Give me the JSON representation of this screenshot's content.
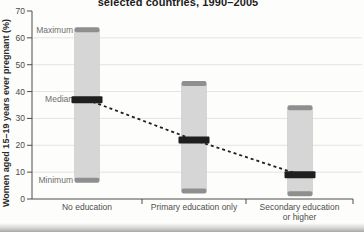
{
  "chart_data": {
    "type": "bar",
    "subtype": "range-bar-min-median-max",
    "title": "selected countries, 1990–2005",
    "ylabel": "Women aged 15–19 years ever pregnant (%)",
    "xlabel": "",
    "ylim": [
      0,
      70
    ],
    "y_ticks": [
      0,
      10,
      20,
      30,
      40,
      50,
      60,
      70
    ],
    "grid": true,
    "legend_position": "none",
    "categories": [
      "No education",
      "Primary education only",
      "Secondary education or higher"
    ],
    "series": [
      {
        "name": "Maximum",
        "values": [
          63,
          43,
          34
        ]
      },
      {
        "name": "Median",
        "values": [
          37,
          22,
          9
        ]
      },
      {
        "name": "Minimum",
        "values": [
          7,
          3,
          2
        ]
      }
    ],
    "median_trend_line": {
      "style": "dashed",
      "values": [
        37,
        22,
        9
      ]
    },
    "annotations": {
      "maximum": "Maximum",
      "median": "Median",
      "minimum": "Minimum"
    },
    "colors": {
      "bar_fill": "#d6d6d6",
      "bar_edge": "#c3c3c3",
      "range_cap": "#8f8f8f",
      "median_band": "#1f1f1f",
      "trend_line": "#1f1f1f",
      "gridline": "#e4e4e4",
      "axis": "#4d4d4d",
      "tick_text": "#4a4a4a",
      "muted_text": "#6e6e6e",
      "title_text": "#1c1c1c"
    }
  }
}
